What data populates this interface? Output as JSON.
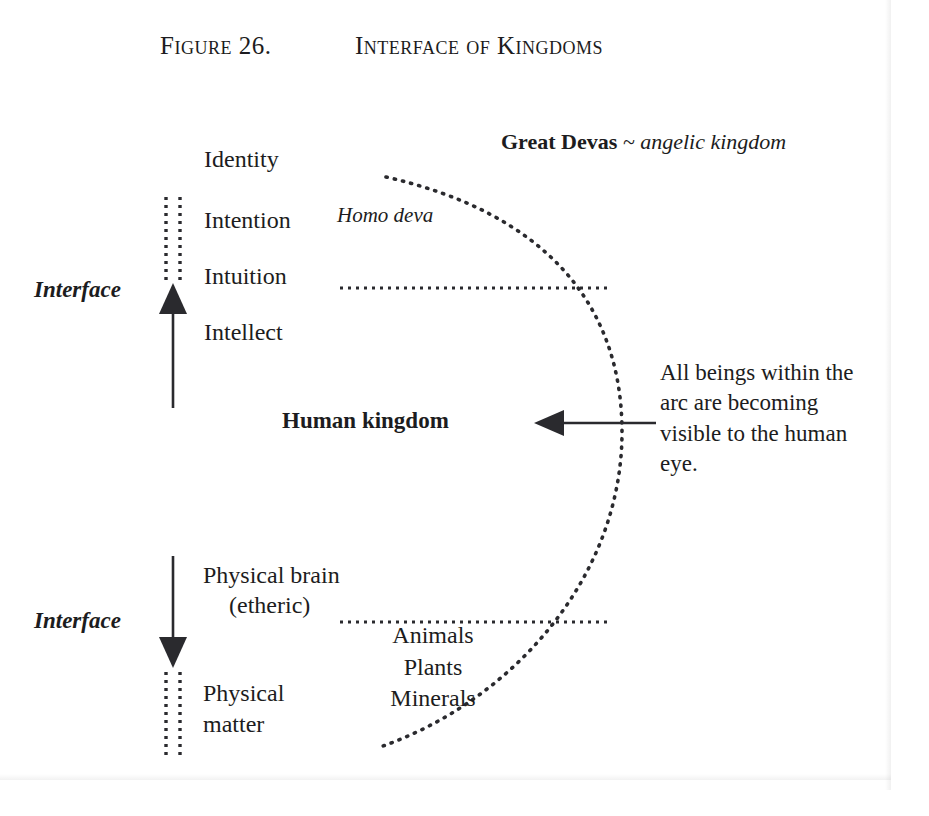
{
  "figure": {
    "number_label": "Figure 26.",
    "title": "Interface of Kingdoms"
  },
  "headline": {
    "bold_part": "Great Devas",
    "italic_part": "~ angelic kingdom"
  },
  "upper_levels": {
    "identity": "Identity",
    "intention": "Intention",
    "intuition": "Intuition",
    "intellect": "Intellect"
  },
  "species_label": "Homo deva",
  "center_label": "Human kingdom",
  "lower_levels": {
    "physical_brain": "Physical brain",
    "etheric": "(etheric)",
    "physical_matter": "Physical\nmatter"
  },
  "lower_kingdoms": {
    "animals": "Animals",
    "plants": "Plants",
    "minerals": "Minerals"
  },
  "interface_labels": {
    "top": "Interface",
    "bottom": "Interface"
  },
  "annotation": {
    "text": "All beings within the arc are becoming visible to the human eye."
  },
  "colors": {
    "ink": "#1c1c20",
    "paper": "#ffffff",
    "dotted": "#2a2a2e"
  },
  "graphics": {
    "arc_name": "dotted-visibility-arc",
    "up_arrow_name": "upward-interface-arrow",
    "down_arrow_name": "downward-interface-arrow",
    "pointer_arrow_name": "human-kingdom-pointer-arrow",
    "upper_divider_name": "upper-dotted-divider",
    "lower_divider_name": "lower-dotted-divider"
  }
}
